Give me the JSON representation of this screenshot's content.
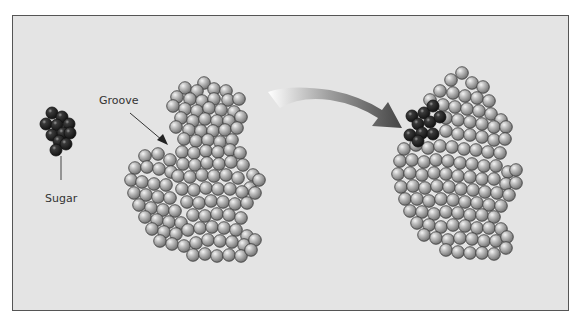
{
  "figure": {
    "labels": {
      "sugar": "Sugar",
      "groove": "Groove"
    },
    "colors": {
      "background": "#e4e4e4",
      "frame_border": "#555555",
      "protein_sphere": "#b4b4b4",
      "sugar_sphere": "#2a2a2a"
    },
    "sugar_molecule": {
      "spheres": [
        [
          52,
          113
        ],
        [
          62,
          117
        ],
        [
          46,
          124
        ],
        [
          57,
          125
        ],
        [
          69,
          124
        ],
        [
          52,
          135
        ],
        [
          63,
          133
        ],
        [
          70,
          133
        ],
        [
          59,
          141
        ],
        [
          66,
          144
        ],
        [
          56,
          150
        ]
      ]
    },
    "protein_left": {
      "spheres": [
        [
          204,
          83
        ],
        [
          185,
          88
        ],
        [
          197,
          91
        ],
        [
          214,
          89
        ],
        [
          226,
          91
        ],
        [
          177,
          97
        ],
        [
          190,
          99
        ],
        [
          202,
          101
        ],
        [
          214,
          99
        ],
        [
          228,
          100
        ],
        [
          239,
          99
        ],
        [
          173,
          106
        ],
        [
          185,
          109
        ],
        [
          197,
          111
        ],
        [
          209,
          108
        ],
        [
          221,
          110
        ],
        [
          234,
          112
        ],
        [
          181,
          118
        ],
        [
          193,
          121
        ],
        [
          205,
          119
        ],
        [
          217,
          121
        ],
        [
          229,
          121
        ],
        [
          241,
          117
        ],
        [
          176,
          127
        ],
        [
          189,
          130
        ],
        [
          201,
          131
        ],
        [
          213,
          131
        ],
        [
          225,
          130
        ],
        [
          237,
          128
        ],
        [
          184,
          139
        ],
        [
          196,
          141
        ],
        [
          208,
          140
        ],
        [
          220,
          142
        ],
        [
          232,
          140
        ],
        [
          145,
          156
        ],
        [
          158,
          154
        ],
        [
          170,
          160
        ],
        [
          182,
          152
        ],
        [
          194,
          153
        ],
        [
          206,
          151
        ],
        [
          218,
          152
        ],
        [
          230,
          150
        ],
        [
          240,
          153
        ],
        [
          135,
          168
        ],
        [
          147,
          167
        ],
        [
          159,
          169
        ],
        [
          171,
          172
        ],
        [
          183,
          164
        ],
        [
          195,
          165
        ],
        [
          207,
          163
        ],
        [
          219,
          164
        ],
        [
          231,
          162
        ],
        [
          243,
          165
        ],
        [
          253,
          175
        ],
        [
          131,
          180
        ],
        [
          142,
          182
        ],
        [
          154,
          184
        ],
        [
          166,
          185
        ],
        [
          178,
          176
        ],
        [
          190,
          177
        ],
        [
          202,
          175
        ],
        [
          214,
          176
        ],
        [
          226,
          175
        ],
        [
          238,
          178
        ],
        [
          250,
          188
        ],
        [
          259,
          180
        ],
        [
          134,
          193
        ],
        [
          146,
          195
        ],
        [
          158,
          197
        ],
        [
          170,
          198
        ],
        [
          182,
          189
        ],
        [
          194,
          190
        ],
        [
          206,
          188
        ],
        [
          218,
          189
        ],
        [
          230,
          189
        ],
        [
          242,
          192
        ],
        [
          255,
          193
        ],
        [
          139,
          205
        ],
        [
          151,
          208
        ],
        [
          163,
          210
        ],
        [
          175,
          211
        ],
        [
          187,
          202
        ],
        [
          199,
          203
        ],
        [
          211,
          201
        ],
        [
          223,
          202
        ],
        [
          235,
          204
        ],
        [
          247,
          203
        ],
        [
          145,
          217
        ],
        [
          157,
          220
        ],
        [
          169,
          222
        ],
        [
          181,
          223
        ],
        [
          193,
          215
        ],
        [
          205,
          216
        ],
        [
          217,
          214
        ],
        [
          229,
          215
        ],
        [
          241,
          218
        ],
        [
          152,
          229
        ],
        [
          164,
          232
        ],
        [
          176,
          234
        ],
        [
          188,
          230
        ],
        [
          200,
          228
        ],
        [
          212,
          227
        ],
        [
          224,
          228
        ],
        [
          236,
          230
        ],
        [
          247,
          236
        ],
        [
          160,
          241
        ],
        [
          172,
          244
        ],
        [
          184,
          246
        ],
        [
          196,
          243
        ],
        [
          208,
          240
        ],
        [
          220,
          241
        ],
        [
          232,
          242
        ],
        [
          244,
          245
        ],
        [
          255,
          240
        ],
        [
          193,
          255
        ],
        [
          205,
          254
        ],
        [
          217,
          256
        ],
        [
          229,
          255
        ],
        [
          241,
          256
        ],
        [
          251,
          250
        ]
      ]
    },
    "protein_right": {
      "spheres": [
        [
          462,
          73
        ],
        [
          451,
          80
        ],
        [
          472,
          83
        ],
        [
          483,
          87
        ],
        [
          440,
          91
        ],
        [
          453,
          93
        ],
        [
          465,
          96
        ],
        [
          477,
          98
        ],
        [
          489,
          101
        ],
        [
          430,
          100
        ],
        [
          443,
          105
        ],
        [
          455,
          107
        ],
        [
          467,
          109
        ],
        [
          479,
          111
        ],
        [
          491,
          114
        ],
        [
          501,
          120
        ],
        [
          446,
          118
        ],
        [
          458,
          120
        ],
        [
          470,
          122
        ],
        [
          482,
          124
        ],
        [
          494,
          127
        ],
        [
          506,
          127
        ],
        [
          446,
          131
        ],
        [
          458,
          134
        ],
        [
          470,
          135
        ],
        [
          482,
          137
        ],
        [
          494,
          140
        ],
        [
          505,
          139
        ],
        [
          404,
          149
        ],
        [
          416,
          145
        ],
        [
          428,
          148
        ],
        [
          440,
          146
        ],
        [
          452,
          147
        ],
        [
          464,
          149
        ],
        [
          476,
          150
        ],
        [
          488,
          152
        ],
        [
          500,
          153
        ],
        [
          400,
          161
        ],
        [
          412,
          160
        ],
        [
          424,
          162
        ],
        [
          436,
          160
        ],
        [
          448,
          161
        ],
        [
          460,
          163
        ],
        [
          472,
          164
        ],
        [
          484,
          166
        ],
        [
          496,
          166
        ],
        [
          508,
          172
        ],
        [
          516,
          170
        ],
        [
          398,
          174
        ],
        [
          410,
          173
        ],
        [
          422,
          175
        ],
        [
          434,
          173
        ],
        [
          446,
          174
        ],
        [
          458,
          176
        ],
        [
          470,
          177
        ],
        [
          482,
          179
        ],
        [
          494,
          179
        ],
        [
          506,
          184
        ],
        [
          516,
          183
        ],
        [
          401,
          187
        ],
        [
          413,
          186
        ],
        [
          425,
          188
        ],
        [
          437,
          186
        ],
        [
          449,
          187
        ],
        [
          461,
          189
        ],
        [
          473,
          190
        ],
        [
          485,
          192
        ],
        [
          497,
          193
        ],
        [
          509,
          195
        ],
        [
          405,
          199
        ],
        [
          417,
          199
        ],
        [
          429,
          201
        ],
        [
          441,
          199
        ],
        [
          453,
          200
        ],
        [
          465,
          202
        ],
        [
          477,
          203
        ],
        [
          489,
          205
        ],
        [
          501,
          206
        ],
        [
          410,
          211
        ],
        [
          422,
          212
        ],
        [
          434,
          214
        ],
        [
          446,
          212
        ],
        [
          458,
          213
        ],
        [
          470,
          215
        ],
        [
          482,
          215
        ],
        [
          494,
          217
        ],
        [
          417,
          223
        ],
        [
          429,
          225
        ],
        [
          441,
          227
        ],
        [
          453,
          225
        ],
        [
          465,
          226
        ],
        [
          477,
          228
        ],
        [
          489,
          228
        ],
        [
          501,
          229
        ],
        [
          424,
          235
        ],
        [
          436,
          238
        ],
        [
          448,
          240
        ],
        [
          460,
          238
        ],
        [
          472,
          239
        ],
        [
          484,
          241
        ],
        [
          496,
          241
        ],
        [
          507,
          237
        ],
        [
          446,
          250
        ],
        [
          458,
          252
        ],
        [
          470,
          253
        ],
        [
          482,
          253
        ],
        [
          494,
          254
        ],
        [
          506,
          248
        ]
      ]
    },
    "protein_right_sugar": {
      "spheres": [
        [
          412,
          116
        ],
        [
          424,
          113
        ],
        [
          433,
          106
        ],
        [
          418,
          124
        ],
        [
          430,
          122
        ],
        [
          440,
          117
        ],
        [
          410,
          135
        ],
        [
          422,
          133
        ],
        [
          433,
          134
        ],
        [
          418,
          141
        ]
      ]
    },
    "groove_pointer": {
      "x1": 130,
      "y1": 113,
      "x2": 166,
      "y2": 143
    },
    "sugar_stem": {
      "x": 61,
      "y1": 156,
      "y2": 180
    }
  }
}
